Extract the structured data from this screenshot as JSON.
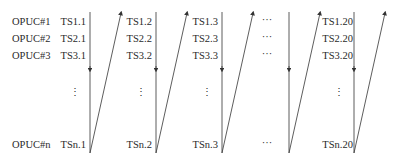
{
  "diagram": {
    "row_labels": [
      "OPUC#1",
      "OPUC#2",
      "OPUC#3",
      "OPUC#n"
    ],
    "columns": [
      {
        "id": "col1",
        "cells": [
          "TS1.1",
          "TS2.1",
          "TS3.1",
          "TSn.1"
        ]
      },
      {
        "id": "col2",
        "cells": [
          "TS1.2",
          "TS2.2",
          "TS3.2",
          "TSn.2"
        ]
      },
      {
        "id": "col3",
        "cells": [
          "TS1.3",
          "TS2.3",
          "TS3.3",
          "TSn.3"
        ]
      },
      {
        "id": "col4-ellipsis",
        "cells": [
          "···",
          "···",
          "···",
          "···"
        ]
      },
      {
        "id": "col20",
        "cells": [
          "TS1.20",
          "TS2.20",
          "TS3.20",
          "TSn.20"
        ]
      }
    ],
    "vertical_ellipsis": "⋮",
    "line_color": "#333333",
    "text_color": "#2a2a2a"
  }
}
